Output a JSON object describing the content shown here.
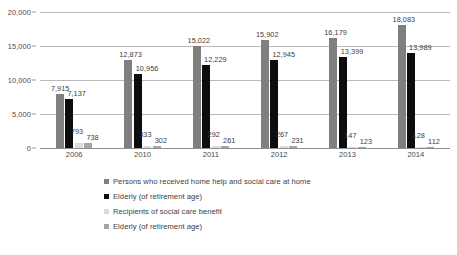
{
  "chart_data": {
    "type": "bar",
    "title": "",
    "xlabel": "",
    "ylabel": "",
    "categories": [
      "2006",
      "2010",
      "2011",
      "2012",
      "2013",
      "2014"
    ],
    "ylim": [
      0,
      20000
    ],
    "yticks": [
      0,
      5000,
      10000,
      15000,
      20000
    ],
    "ytick_labels": [
      "0",
      "5,000",
      "10,000",
      "15,000",
      "20,000"
    ],
    "grid": true,
    "legend_position": "bottom",
    "series": [
      {
        "name": "Persons who received home help and social care at home",
        "color": "#7f7f7f",
        "values": [
          7915,
          12873,
          15022,
          15902,
          16179,
          18083
        ],
        "labels": [
          "7,915",
          "12,873",
          "15,022",
          "15,902",
          "16,179",
          "18,083"
        ]
      },
      {
        "name": "Elderly (of retirement age)",
        "color": "#0d0d0d",
        "values": [
          7137,
          10956,
          12229,
          12945,
          13399,
          13989
        ],
        "labels": [
          "7,137",
          "10,956",
          "12,229",
          "12,945",
          "13,399",
          "13,989"
        ]
      },
      {
        "name": "Recipients of social care benefit",
        "color": "#dcdcdc",
        "values": [
          793,
          333,
          292,
          267,
          147,
          128
        ],
        "labels": [
          "793",
          "333",
          "292",
          "267",
          "147",
          "128"
        ]
      },
      {
        "name": "Elderly (of retirement age)",
        "color": "#a6a6a6",
        "values": [
          738,
          302,
          261,
          231,
          123,
          112
        ],
        "labels": [
          "738",
          "302",
          "261",
          "231",
          "123",
          "112"
        ]
      }
    ]
  }
}
